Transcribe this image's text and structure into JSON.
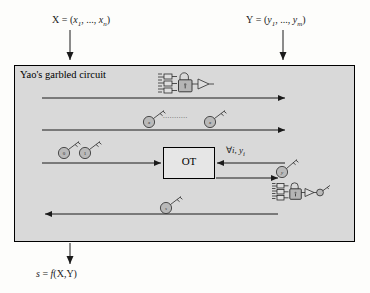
{
  "figure": {
    "panel_label": "Yao's garbled circuit",
    "ot_label": "OT",
    "background_color": "#fdfdfb",
    "panel_color": "#d9d9d9",
    "line_color": "#1a1a1a"
  },
  "inputs": {
    "left": {
      "name": "X",
      "equals": "=",
      "tuple_open": "(",
      "first": "x",
      "first_sub": "1",
      "ellipsis": ", ..., ",
      "last": "x",
      "last_sub": "n",
      "tuple_close": ")",
      "full": "X = (x1, ..., xn)"
    },
    "right": {
      "name": "Y",
      "equals": "=",
      "tuple_open": "(",
      "first": "y",
      "first_sub": "1",
      "ellipsis": ", ..., ",
      "last": "y",
      "last_sub": "m",
      "tuple_close": ")",
      "full": "Y = (y1, ..., ym)"
    }
  },
  "output": {
    "text": "s = f(X,Y)",
    "name": "s",
    "equals": "=",
    "fn": "f",
    "args": "(X,Y)"
  },
  "messages": [
    {
      "id": "garbled-circuit",
      "direction": "left-to-right",
      "payload": "garbled circuit",
      "icon": "locked-circuit-icon"
    },
    {
      "id": "garbled-input-keys",
      "direction": "left-to-right",
      "payload": "keys for sender inputs",
      "icon": "key-icon",
      "key_labels": [
        "x1",
        "xn"
      ],
      "ellipsis": "..........."
    },
    {
      "id": "oblivious-transfer",
      "direction": "into-ot",
      "payload": "key pair per receiver input bit",
      "icon": "key-icon",
      "key_labels": [
        "0",
        "1"
      ]
    },
    {
      "id": "ot-query",
      "direction": "right-to-left",
      "payload": "for all i, yi",
      "label": "∀i , yi",
      "label_parts": {
        "forall": "∀",
        "index": "i",
        "comma": ",",
        "var": "y",
        "var_sub": "i"
      }
    },
    {
      "id": "ot-response",
      "direction": "left-to-right",
      "payload": "selected key",
      "icon": "key-icon",
      "key_labels": [
        "yi"
      ]
    },
    {
      "id": "evaluated-result",
      "direction": "right-to-left",
      "payload": "output key",
      "icon": "key-icon",
      "key_labels": [
        "s"
      ]
    }
  ],
  "icons": {
    "locked_circuit": "locked-circuit-icon",
    "unlocked_circuit": "unlocked-circuit-icon",
    "key": "key-icon",
    "padlock": "padlock-icon",
    "arrow": "arrow-icon"
  }
}
